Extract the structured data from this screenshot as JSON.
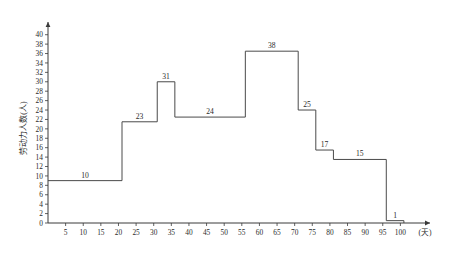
{
  "chart_data": {
    "type": "bar",
    "title": "",
    "subtitle": "",
    "xlabel": "(天)",
    "ylabel": "劳动力人数(人)",
    "xlim": [
      0,
      105
    ],
    "ylim": [
      0,
      41
    ],
    "grid": false,
    "legend": null,
    "x_ticks": [
      5,
      10,
      15,
      20,
      25,
      30,
      35,
      40,
      45,
      50,
      55,
      60,
      65,
      70,
      75,
      80,
      85,
      90,
      95,
      100
    ],
    "y_ticks": [
      0,
      2,
      4,
      6,
      8,
      10,
      12,
      14,
      16,
      18,
      20,
      22,
      24,
      26,
      28,
      30,
      32,
      34,
      36,
      38,
      40
    ],
    "steps": [
      {
        "x_start": 0,
        "x_end": 21,
        "height": 9,
        "label": "10"
      },
      {
        "x_start": 21,
        "x_end": 31,
        "height": 21.5,
        "label": "23"
      },
      {
        "x_start": 31,
        "x_end": 36,
        "height": 30,
        "label": "31"
      },
      {
        "x_start": 36,
        "x_end": 56,
        "height": 22.5,
        "label": "24"
      },
      {
        "x_start": 56,
        "x_end": 71,
        "height": 36.5,
        "label": "38"
      },
      {
        "x_start": 71,
        "x_end": 76,
        "height": 24,
        "label": "25"
      },
      {
        "x_start": 76,
        "x_end": 81,
        "height": 15.5,
        "label": "17"
      },
      {
        "x_start": 81,
        "x_end": 96,
        "height": 13.5,
        "label": "15"
      },
      {
        "x_start": 96,
        "x_end": 101,
        "height": 0.5,
        "label": "1"
      }
    ],
    "colors": {
      "axis": "#3a3a3a",
      "line": "#4a4a4a",
      "text": "#2b2b2b",
      "background": "#ffffff"
    }
  }
}
